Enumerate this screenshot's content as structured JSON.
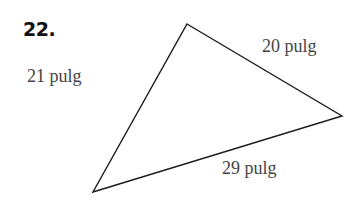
{
  "problem": {
    "number": "22."
  },
  "triangle": {
    "vertices": {
      "top": [
        187,
        24
      ],
      "right": [
        342,
        116
      ],
      "bottom_left": [
        93,
        192
      ]
    },
    "sides": [
      {
        "id": "left",
        "label": "21 pulg"
      },
      {
        "id": "top_right",
        "label": "20 pulg"
      },
      {
        "id": "bottom",
        "label": "29 pulg"
      }
    ]
  }
}
